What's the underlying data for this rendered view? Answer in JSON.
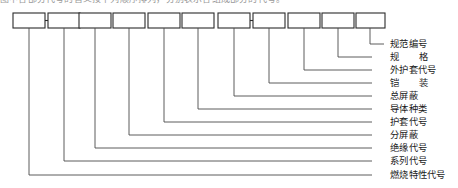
{
  "caption": {
    "text": "图中各部分代号的含义按下列顺序排列，分别表示各组成部分的代号。"
  },
  "diagram": {
    "box_count": 11,
    "boxes": [
      {
        "index": 1,
        "value": "",
        "label": "燃烧特性代号"
      },
      {
        "index": 2,
        "value": "",
        "label": "系列代号"
      },
      {
        "index": 3,
        "value": "",
        "label": "绝缘代号"
      },
      {
        "index": 4,
        "value": "",
        "label": "分屏蔽"
      },
      {
        "index": 5,
        "value": "",
        "label": "护套代号"
      },
      {
        "index": 6,
        "value": "",
        "label": "导体种类"
      },
      {
        "index": 7,
        "value": "",
        "label": "总屏蔽"
      },
      {
        "index": 8,
        "value": "",
        "label": "铠　装"
      },
      {
        "index": 9,
        "value": "",
        "label": "外护套代号"
      },
      {
        "index": 10,
        "value": "",
        "label": "规　格"
      },
      {
        "index": 11,
        "value": "",
        "label": "规范编号"
      }
    ],
    "connectors": [
      {
        "from_box": 1,
        "to_box": 2
      },
      {
        "from_box": 7,
        "to_box": 8
      }
    ],
    "colors": {
      "box_stroke": "#2b2b2b",
      "leader_line": "#4a4a4a",
      "label_text": "#1a1a1a",
      "background": "#ffffff"
    }
  }
}
